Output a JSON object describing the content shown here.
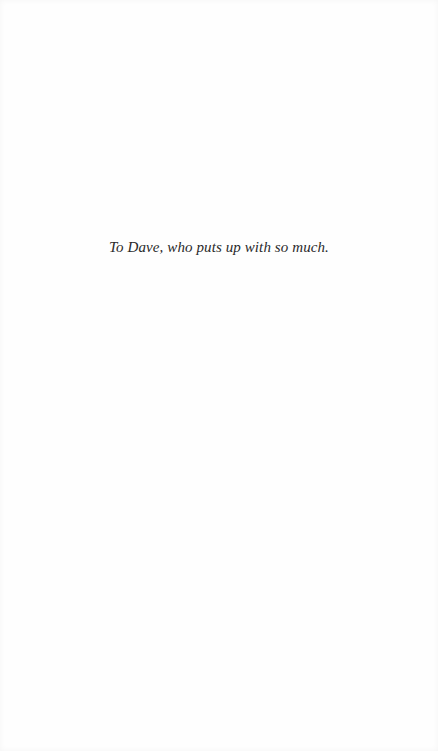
{
  "page": {
    "type": "dedication",
    "background_color": "#fefefe",
    "text_color": "#2a2a2a"
  },
  "dedication": {
    "text": "To Dave, who puts up with so much."
  }
}
